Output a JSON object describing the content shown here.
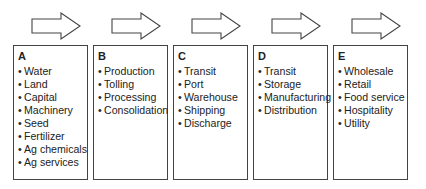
{
  "stages": [
    {
      "label": "A",
      "items": [
        "Water",
        "Land",
        "Capital",
        "Machinery",
        "Seed",
        "Fertilizer",
        "Ag chemicals",
        "Ag services"
      ]
    },
    {
      "label": "B",
      "items": [
        "Production",
        "Tolling",
        "Processing",
        "Consolidation"
      ]
    },
    {
      "label": "C",
      "items": [
        "Transit",
        "Port",
        "Warehouse",
        "Shipping",
        "Discharge"
      ]
    },
    {
      "label": "D",
      "items": [
        "Transit",
        "Storage",
        "Manufacturing",
        "Distribution"
      ]
    },
    {
      "label": "E",
      "items": [
        "Wholesale",
        "Retail",
        "Food service",
        "Hospitality",
        "Utility"
      ]
    }
  ],
  "bullet": "•",
  "icons": {
    "flow_arrow": "right-arrow-outline"
  },
  "colors": {
    "border": "#444444",
    "text": "#222222",
    "background": "#ffffff"
  }
}
